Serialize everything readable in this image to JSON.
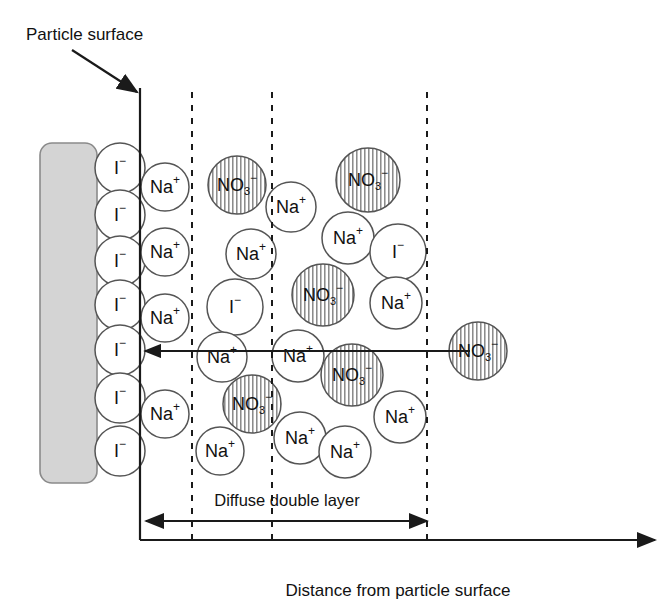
{
  "diagram": {
    "title_label": "Particle surface",
    "axis_label": "Distance from particle surface",
    "layer_label": "Diffuse double layer",
    "colors": {
      "particle_fill": "#d4d4d4",
      "particle_stroke": "#8a8a8a",
      "ion_stroke": "#555555",
      "line": "#1a1a1a",
      "hatch": "#777777",
      "text": "#111111"
    },
    "particle": {
      "x": 40,
      "y": 143,
      "width": 57,
      "height": 340,
      "radius": 12
    },
    "surface_line": {
      "x": 140,
      "y_top": 88,
      "y_bottom": 540
    },
    "baseline": {
      "y": 540,
      "x_start": 140,
      "x_end": 655
    },
    "dashed_lines": [
      {
        "x": 192,
        "y_top": 92,
        "y_bottom": 540
      },
      {
        "x": 272,
        "y_top": 92,
        "y_bottom": 540
      },
      {
        "x": 427,
        "y_top": 92,
        "y_bottom": 540
      }
    ],
    "pointer_arrow": {
      "x1": 72,
      "y1": 50,
      "x2": 137,
      "y2": 92
    },
    "flux_arrow": {
      "x1": 470,
      "y1": 351,
      "x2": 145,
      "y2": 351
    },
    "span_arrow": {
      "x1": 146,
      "y1": 521,
      "x2": 427,
      "y2": 521,
      "label_x": 287,
      "label_y": 506
    },
    "ion_species": {
      "iodide": {
        "symbol": "I",
        "charge": "−",
        "subscript": "",
        "hatched": false
      },
      "sodium": {
        "symbol": "Na",
        "charge": "+",
        "subscript": "",
        "hatched": false
      },
      "nitrate": {
        "symbol": "NO",
        "charge": "−",
        "subscript": "3",
        "hatched": true
      }
    },
    "ions": [
      {
        "type": "iodide",
        "cx": 120,
        "cy": 168,
        "r": 25
      },
      {
        "type": "iodide",
        "cx": 120,
        "cy": 215,
        "r": 25
      },
      {
        "type": "iodide",
        "cx": 120,
        "cy": 261,
        "r": 25
      },
      {
        "type": "iodide",
        "cx": 120,
        "cy": 305,
        "r": 25
      },
      {
        "type": "iodide",
        "cx": 120,
        "cy": 350,
        "r": 25
      },
      {
        "type": "iodide",
        "cx": 120,
        "cy": 398,
        "r": 25
      },
      {
        "type": "iodide",
        "cx": 120,
        "cy": 451,
        "r": 25
      },
      {
        "type": "sodium",
        "cx": 165,
        "cy": 187,
        "r": 24
      },
      {
        "type": "sodium",
        "cx": 165,
        "cy": 252,
        "r": 24
      },
      {
        "type": "sodium",
        "cx": 165,
        "cy": 318,
        "r": 24
      },
      {
        "type": "sodium",
        "cx": 165,
        "cy": 414,
        "r": 24
      },
      {
        "type": "nitrate",
        "cx": 237,
        "cy": 185,
        "r": 29
      },
      {
        "type": "sodium",
        "cx": 251,
        "cy": 254,
        "r": 25
      },
      {
        "type": "iodide",
        "cx": 235,
        "cy": 307,
        "r": 28
      },
      {
        "type": "sodium",
        "cx": 222,
        "cy": 357,
        "r": 25
      },
      {
        "type": "nitrate",
        "cx": 252,
        "cy": 404,
        "r": 29
      },
      {
        "type": "sodium",
        "cx": 220,
        "cy": 451,
        "r": 24
      },
      {
        "type": "sodium",
        "cx": 291,
        "cy": 207,
        "r": 25
      },
      {
        "type": "sodium",
        "cx": 298,
        "cy": 356,
        "r": 26
      },
      {
        "type": "sodium",
        "cx": 300,
        "cy": 438,
        "r": 26
      },
      {
        "type": "nitrate",
        "cx": 368,
        "cy": 180,
        "r": 32
      },
      {
        "type": "sodium",
        "cx": 348,
        "cy": 238,
        "r": 26
      },
      {
        "type": "nitrate",
        "cx": 323,
        "cy": 295,
        "r": 31
      },
      {
        "type": "nitrate",
        "cx": 352,
        "cy": 375,
        "r": 31
      },
      {
        "type": "sodium",
        "cx": 345,
        "cy": 452,
        "r": 26
      },
      {
        "type": "iodide",
        "cx": 398,
        "cy": 252,
        "r": 28
      },
      {
        "type": "sodium",
        "cx": 396,
        "cy": 303,
        "r": 26
      },
      {
        "type": "sodium",
        "cx": 400,
        "cy": 417,
        "r": 26
      },
      {
        "type": "nitrate",
        "cx": 478,
        "cy": 351,
        "r": 29
      }
    ]
  }
}
